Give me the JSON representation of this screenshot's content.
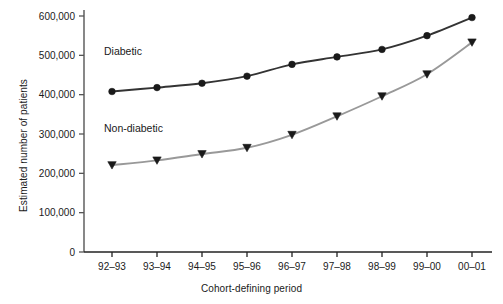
{
  "chart_data": {
    "type": "line",
    "title": "",
    "xlabel": "Cohort-defining period",
    "ylabel": "Estimated number of patients",
    "categories": [
      "92–93",
      "93–94",
      "94–95",
      "95–96",
      "96–97",
      "97–98",
      "98–99",
      "99–00",
      "00–01"
    ],
    "ylim": [
      0,
      600000
    ],
    "yticks": [
      0,
      100000,
      200000,
      300000,
      400000,
      500000,
      600000
    ],
    "ytick_labels": [
      "0",
      "100,000",
      "200,000",
      "300,000",
      "400,000",
      "500,000",
      "600,000"
    ],
    "grid": false,
    "legend_position": "inline-annotations",
    "series": [
      {
        "name": "Diabetic",
        "color": "#333333",
        "marker": "circle",
        "values": [
          408000,
          418000,
          429000,
          447000,
          477000,
          496000,
          515000,
          550000,
          596000
        ]
      },
      {
        "name": "Non-diabetic",
        "color": "#999999",
        "marker": "triangle-down",
        "values": [
          221000,
          233000,
          249000,
          265000,
          298000,
          345000,
          396000,
          452000,
          533000
        ]
      }
    ],
    "annotations": [
      {
        "text": "Diabetic",
        "x_index": 0,
        "value": 500000
      },
      {
        "text": "Non-diabetic",
        "x_index": 0,
        "value": 305000
      }
    ]
  }
}
